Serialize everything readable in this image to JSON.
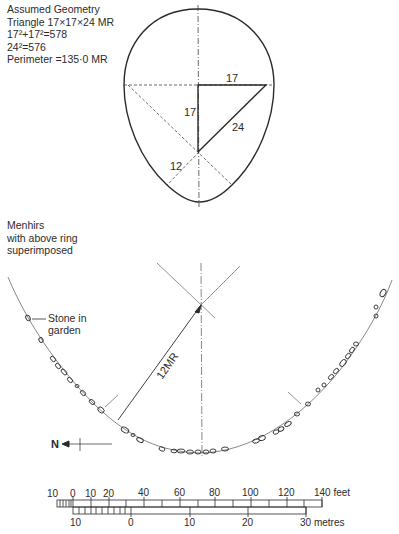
{
  "geometry_notes": {
    "lines": [
      "Assumed Geometry",
      "Triangle 17×17×24 MR",
      "17²+17²=578",
      "24²=576",
      "Perimeter =135·0 MR"
    ]
  },
  "egg_diagram": {
    "labels": {
      "top_leg": "17",
      "vertical_leg": "17",
      "hypotenuse": "24",
      "small_radius": "12"
    }
  },
  "menhirs_caption": {
    "lines": [
      "Menhirs",
      "with above ring",
      "superimposed"
    ]
  },
  "site_plan": {
    "radius_label": "12MR",
    "stone_label_line1": "Stone in",
    "stone_label_line2": "garden",
    "north_label": "N"
  },
  "scale_bar": {
    "feet_labels": [
      "10",
      "0",
      "10",
      "20",
      "40",
      "60",
      "80",
      "100",
      "120",
      "140 feet"
    ],
    "metre_labels": [
      "10",
      "0",
      "10",
      "20",
      "30 metres"
    ]
  },
  "colors": {
    "ink": "#2b2b2b",
    "light_ink": "#6a6a6a",
    "background": "#ffffff"
  }
}
